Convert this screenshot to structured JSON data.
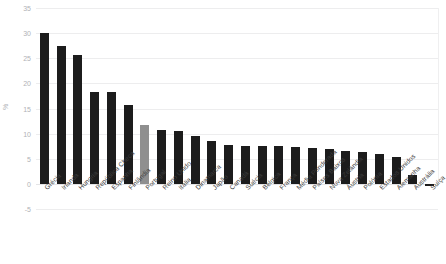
{
  "chart_data": {
    "type": "bar",
    "title": "",
    "xlabel": "",
    "ylabel": "%",
    "ylim": [
      -5,
      35
    ],
    "yticks": [
      35,
      30,
      25,
      20,
      15,
      10,
      5,
      0,
      -5
    ],
    "grid": true,
    "legend": false,
    "highlight_category": "Portugal",
    "colors": {
      "bar": "#1c1c1c",
      "highlight": "#8f8f8f",
      "grid": "#ededee",
      "tick_text": "#b0b2b6",
      "label_text": "#3c3c3c",
      "background": "#ffffff"
    },
    "categories": [
      "Grécia",
      "Irlanda",
      "Hungria",
      "República Checa",
      "Espanha",
      "Finlândia",
      "Portugal",
      "Reino Unido",
      "Itália",
      "Dinamarca",
      "Japão",
      "Canadá",
      "Suécia",
      "Bélgica",
      "França",
      "Média Ponderada",
      "Países Baixos",
      "Nova Zelândia",
      "Áustria",
      "Polónia",
      "Estados Unidos",
      "Alemanha",
      "Austrália",
      "Suíça"
    ],
    "values": [
      30.0,
      27.5,
      25.6,
      18.3,
      18.3,
      15.8,
      11.8,
      10.8,
      10.5,
      9.6,
      8.6,
      7.8,
      7.6,
      7.5,
      7.5,
      7.4,
      7.2,
      7.0,
      6.6,
      6.4,
      5.9,
      5.4,
      1.7,
      -0.3
    ]
  }
}
